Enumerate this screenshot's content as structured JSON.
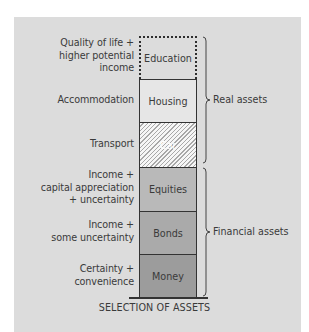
{
  "diagram": {
    "title": "SELECTION OF ASSETS",
    "blocks": [
      {
        "label": "Education",
        "description": "Quality of life +\nhigher potential\nincome",
        "style": "dotted-outline"
      },
      {
        "label": "Housing",
        "description": "Accommodation",
        "style": "light-gray"
      },
      {
        "label": "Car",
        "description": "Transport",
        "style": "hatched"
      },
      {
        "label": "Equities",
        "description": "Income +\ncapital appreciation\n+ uncertainty",
        "style": "mid-gray"
      },
      {
        "label": "Bonds",
        "description": "Income +\nsome uncertainty",
        "style": "gray"
      },
      {
        "label": "Money",
        "description": "Certainty +\nconvenience",
        "style": "dark-gray"
      }
    ],
    "groups": [
      {
        "label": "Real assets",
        "members": [
          "Education",
          "Housing",
          "Car"
        ]
      },
      {
        "label": "Financial assets",
        "members": [
          "Equities",
          "Bonds",
          "Money"
        ]
      }
    ],
    "colors": {
      "background": "#dcdcdc",
      "housing": "#e6e6e6",
      "equities": "#b9b9b9",
      "bonds": "#aaaaaa",
      "money": "#9c9c9c",
      "text": "#3a3a3a"
    }
  }
}
